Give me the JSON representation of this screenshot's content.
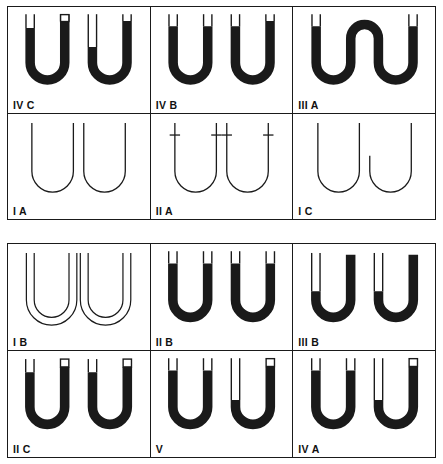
{
  "figure": {
    "title": "",
    "colors": {
      "ink": "#111111",
      "fill": "#1a1a1a",
      "paper": "#ffffff",
      "border": "#1a1a1a"
    },
    "panels": [
      {
        "name": "upper-panel",
        "rows": [
          {
            "cells": [
              {
                "label": "IV C",
                "variant": "ivc"
              },
              {
                "label": "IV B",
                "variant": "ivb"
              },
              {
                "label": "III A",
                "variant": "iiia"
              }
            ]
          },
          {
            "cells": [
              {
                "label": "I A",
                "variant": "ia"
              },
              {
                "label": "II A",
                "variant": "iia"
              },
              {
                "label": "I C",
                "variant": "ic"
              }
            ]
          }
        ]
      },
      {
        "name": "lower-panel",
        "rows": [
          {
            "cells": [
              {
                "label": "I B",
                "variant": "ib"
              },
              {
                "label": "II B",
                "variant": "iib"
              },
              {
                "label": "III B",
                "variant": "iiib"
              }
            ]
          },
          {
            "cells": [
              {
                "label": "II C",
                "variant": "iic"
              },
              {
                "label": "V",
                "variant": "v"
              },
              {
                "label": "IV A",
                "variant": "iva"
              }
            ]
          }
        ]
      }
    ]
  }
}
